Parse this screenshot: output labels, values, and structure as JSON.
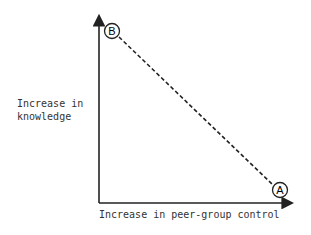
{
  "diagram": {
    "y_axis_label_line1": "Increase in",
    "y_axis_label_line2": "knowledge",
    "x_axis_label": "Increase in peer-group control",
    "points": [
      {
        "label": "B",
        "position": "top-left"
      },
      {
        "label": "A",
        "position": "bottom-right"
      }
    ],
    "connector": "dashed line from B to A"
  }
}
